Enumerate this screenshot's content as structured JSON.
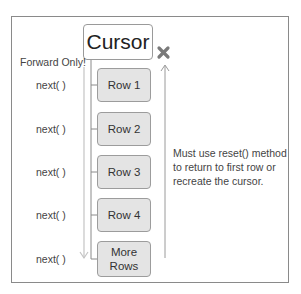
{
  "diagram": {
    "title": "Cursor",
    "direction_label": "Forward Only!",
    "rows": [
      {
        "label": "Row 1",
        "top": 68
      },
      {
        "label": "Row 2",
        "top": 112
      },
      {
        "label": "Row 3",
        "top": 155
      },
      {
        "label": "Row 4",
        "top": 198
      }
    ],
    "more_rows": {
      "line1": "More",
      "line2": "Rows"
    },
    "next_labels": [
      "next( )",
      "next( )",
      "next( )",
      "next( )",
      "next( )"
    ],
    "note": "Must use reset() method to return to first row or recreate the cursor.",
    "icons": {
      "blocked": "x-mark-icon",
      "forward_arrow": "down-arrow-icon",
      "backward_arrow": "up-arrow-icon"
    },
    "colors": {
      "row_fill": "#e4e4e4",
      "border": "#9c9c9c",
      "x_mark": "#7a7a7a",
      "arrow": "#b5b5b5"
    }
  }
}
